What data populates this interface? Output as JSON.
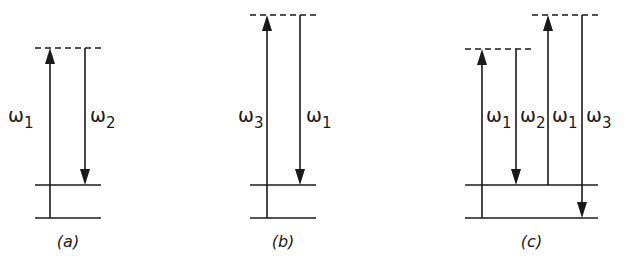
{
  "figure": {
    "panels": [
      {
        "id": "a",
        "caption": "(a)",
        "levels": {
          "ground_y": 218,
          "middle_y": 185,
          "x1": 35,
          "x2": 101
        },
        "virtual_levels": [
          {
            "y": 48,
            "x1": 35,
            "x2": 101
          }
        ],
        "transitions": [
          {
            "symbol": "ω",
            "sub": "1",
            "direction": "up",
            "x": 50,
            "from_y": 218,
            "to_y": 48,
            "label_x": 8,
            "label_y": 122
          },
          {
            "symbol": "ω",
            "sub": "2",
            "direction": "down",
            "x": 85,
            "from_y": 48,
            "to_y": 185,
            "label_x": 90,
            "label_y": 122
          }
        ]
      },
      {
        "id": "b",
        "caption": "(b)",
        "levels": {
          "ground_y": 218,
          "middle_y": 185,
          "x1": 250,
          "x2": 316
        },
        "virtual_levels": [
          {
            "y": 15,
            "x1": 250,
            "x2": 316
          }
        ],
        "transitions": [
          {
            "symbol": "ω",
            "sub": "3",
            "direction": "up",
            "x": 267,
            "from_y": 218,
            "to_y": 15,
            "label_x": 238,
            "label_y": 122
          },
          {
            "symbol": "ω",
            "sub": "1",
            "direction": "down",
            "x": 300,
            "from_y": 15,
            "to_y": 185,
            "label_x": 306,
            "label_y": 122
          }
        ]
      },
      {
        "id": "c",
        "caption": "(c)",
        "levels": {
          "ground_y": 218,
          "middle_y": 185,
          "x1": 465,
          "x2": 598
        },
        "virtual_levels": [
          {
            "y": 49,
            "x1": 465,
            "x2": 532
          },
          {
            "y": 15,
            "x1": 532,
            "x2": 598
          }
        ],
        "transitions": [
          {
            "symbol": "ω",
            "sub": "1",
            "direction": "up",
            "x": 482,
            "from_y": 218,
            "to_y": 49,
            "label_x": 486,
            "label_y": 122
          },
          {
            "symbol": "ω",
            "sub": "2",
            "direction": "down",
            "x": 516,
            "from_y": 49,
            "to_y": 185,
            "label_x": 520,
            "label_y": 122
          },
          {
            "symbol": "ω",
            "sub": "1",
            "direction": "up",
            "x": 548,
            "from_y": 185,
            "to_y": 15,
            "label_x": 552,
            "label_y": 122
          },
          {
            "symbol": "ω",
            "sub": "3",
            "direction": "down",
            "x": 582,
            "from_y": 15,
            "to_y": 218,
            "label_x": 586,
            "label_y": 122
          }
        ]
      }
    ],
    "caption_y": 247,
    "colors": {
      "ink": "#1a1a1a",
      "background": "#ffffff"
    }
  }
}
